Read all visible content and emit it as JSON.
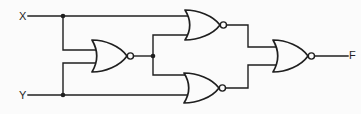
{
  "diagram": {
    "type": "logic-circuit",
    "background": "#fbfbfb",
    "line_color": "#1f1f1f",
    "labels": {
      "input_x": "X",
      "input_y": "Y",
      "output_f": "F"
    },
    "gates": [
      {
        "id": "nor1",
        "type": "NOR",
        "inputs": [
          "X",
          "Y"
        ],
        "output": "n1"
      },
      {
        "id": "nor2",
        "type": "NOR",
        "inputs": [
          "X",
          "n1"
        ],
        "output": "n2"
      },
      {
        "id": "nor3",
        "type": "NOR",
        "inputs": [
          "n1",
          "Y"
        ],
        "output": "n3"
      },
      {
        "id": "nor4",
        "type": "NOR",
        "inputs": [
          "n2",
          "n3"
        ],
        "output": "F"
      }
    ]
  }
}
